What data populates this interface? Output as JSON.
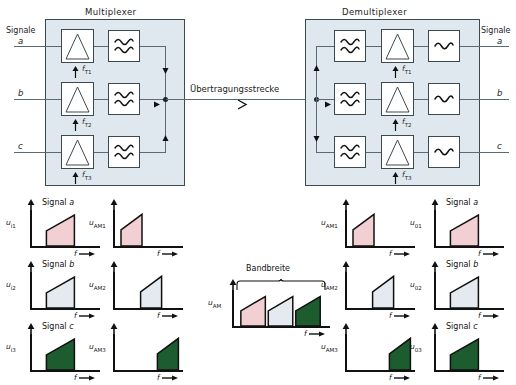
{
  "diagram": {
    "multiplexer": {
      "title": "Multiplexer",
      "input_group_label": "Signale",
      "inputs": [
        "a",
        "b",
        "c"
      ],
      "carriers": [
        "f",
        "f",
        "f"
      ],
      "carrier_subs": [
        "T1",
        "T2",
        "T3"
      ],
      "mixer_icon": "mixer-triangle-icon",
      "filter_icon": "bandpass-filter-icon"
    },
    "channel": {
      "label": "Übertragungsstrecke",
      "arrow_icon": "arrow-right-icon"
    },
    "demultiplexer": {
      "title": "Demultiplexer",
      "output_group_label": "Signale",
      "outputs": [
        "a",
        "b",
        "c"
      ],
      "carriers": [
        "f",
        "f",
        "f"
      ],
      "carrier_subs": [
        "T1",
        "T2",
        "T3"
      ],
      "bandpass_icon": "bandpass-filter-icon",
      "mixer_icon": "mixer-triangle-icon",
      "lowpass_icon": "lowpass-filter-icon"
    }
  },
  "colors": {
    "stage_fill": "#dfe8ee",
    "stage_stroke": "#3b4a52",
    "wire": "#5b6a72",
    "signal_a": "#f2cfd2",
    "signal_b": "#e4eaef",
    "signal_c": "#1d5c2e",
    "axis": "#111111"
  },
  "chart_data": [
    {
      "id": "u_i1",
      "type": "bar",
      "title": "Signal a",
      "title_italic": "a",
      "ylabel": "u",
      "ylabel_sub": "i1",
      "xlabel": "f",
      "fill": "#f2cfd2",
      "bands": [
        {
          "x0": 0.22,
          "x1": 0.62,
          "h0": 0.42,
          "h1": 0.86
        }
      ]
    },
    {
      "id": "u_i2",
      "type": "bar",
      "title": "Signal b",
      "title_italic": "b",
      "ylabel": "u",
      "ylabel_sub": "i2",
      "xlabel": "f",
      "fill": "#e4eaef",
      "bands": [
        {
          "x0": 0.22,
          "x1": 0.62,
          "h0": 0.42,
          "h1": 0.86
        }
      ]
    },
    {
      "id": "u_i3",
      "type": "bar",
      "title": "Signal c",
      "title_italic": "c",
      "ylabel": "u",
      "ylabel_sub": "i3",
      "xlabel": "f",
      "fill": "#1d5c2e",
      "bands": [
        {
          "x0": 0.22,
          "x1": 0.62,
          "h0": 0.42,
          "h1": 0.86
        }
      ]
    },
    {
      "id": "u_AM1",
      "type": "bar",
      "title": "",
      "ylabel": "u",
      "ylabel_sub": "AM1",
      "xlabel": "f",
      "fill": "#f2cfd2",
      "bands": [
        {
          "x0": 0.1,
          "x1": 0.4,
          "h0": 0.45,
          "h1": 0.88
        }
      ]
    },
    {
      "id": "u_AM2",
      "type": "bar",
      "title": "",
      "ylabel": "u",
      "ylabel_sub": "AM2",
      "xlabel": "f",
      "fill": "#e4eaef",
      "bands": [
        {
          "x0": 0.38,
          "x1": 0.68,
          "h0": 0.45,
          "h1": 0.88
        }
      ]
    },
    {
      "id": "u_AM3",
      "type": "bar",
      "title": "",
      "ylabel": "u",
      "ylabel_sub": "AM3",
      "xlabel": "f",
      "fill": "#1d5c2e",
      "bands": [
        {
          "x0": 0.62,
          "x1": 0.92,
          "h0": 0.45,
          "h1": 0.88
        }
      ]
    },
    {
      "id": "u_AM_band",
      "type": "bar",
      "title": "Bandbreite",
      "ylabel": "u",
      "ylabel_sub": "AM",
      "xlabel": "f",
      "bands": [
        {
          "x0": 0.08,
          "x1": 0.33,
          "h0": 0.42,
          "h1": 0.82,
          "fill": "#f2cfd2"
        },
        {
          "x0": 0.36,
          "x1": 0.61,
          "h0": 0.42,
          "h1": 0.82,
          "fill": "#e4eaef"
        },
        {
          "x0": 0.64,
          "x1": 0.89,
          "h0": 0.42,
          "h1": 0.82,
          "fill": "#1d5c2e"
        }
      ]
    },
    {
      "id": "u_AM1_rx",
      "type": "bar",
      "title": "",
      "ylabel": "u",
      "ylabel_sub": "AM1",
      "xlabel": "f",
      "fill": "#f2cfd2",
      "bands": [
        {
          "x0": 0.1,
          "x1": 0.4,
          "h0": 0.45,
          "h1": 0.88
        }
      ]
    },
    {
      "id": "u_AM2_rx",
      "type": "bar",
      "title": "",
      "ylabel": "u",
      "ylabel_sub": "AM2",
      "xlabel": "f",
      "fill": "#e4eaef",
      "bands": [
        {
          "x0": 0.38,
          "x1": 0.68,
          "h0": 0.45,
          "h1": 0.88
        }
      ]
    },
    {
      "id": "u_AM3_rx",
      "type": "bar",
      "title": "",
      "ylabel": "u",
      "ylabel_sub": "AM3",
      "xlabel": "f",
      "fill": "#1d5c2e",
      "bands": [
        {
          "x0": 0.62,
          "x1": 0.92,
          "h0": 0.45,
          "h1": 0.88
        }
      ]
    },
    {
      "id": "u_o1",
      "type": "bar",
      "title": "Signal a",
      "title_italic": "a",
      "ylabel": "u",
      "ylabel_sub": "01",
      "xlabel": "f",
      "fill": "#f2cfd2",
      "bands": [
        {
          "x0": 0.22,
          "x1": 0.62,
          "h0": 0.42,
          "h1": 0.86
        }
      ]
    },
    {
      "id": "u_o2",
      "type": "bar",
      "title": "Signal b",
      "title_italic": "b",
      "ylabel": "u",
      "ylabel_sub": "02",
      "xlabel": "f",
      "fill": "#e4eaef",
      "bands": [
        {
          "x0": 0.22,
          "x1": 0.62,
          "h0": 0.42,
          "h1": 0.86
        }
      ]
    },
    {
      "id": "u_o3",
      "type": "bar",
      "title": "Signal c",
      "title_italic": "c",
      "ylabel": "u",
      "ylabel_sub": "03",
      "xlabel": "f",
      "fill": "#1d5c2e",
      "bands": [
        {
          "x0": 0.22,
          "x1": 0.62,
          "h0": 0.42,
          "h1": 0.86
        }
      ]
    }
  ]
}
